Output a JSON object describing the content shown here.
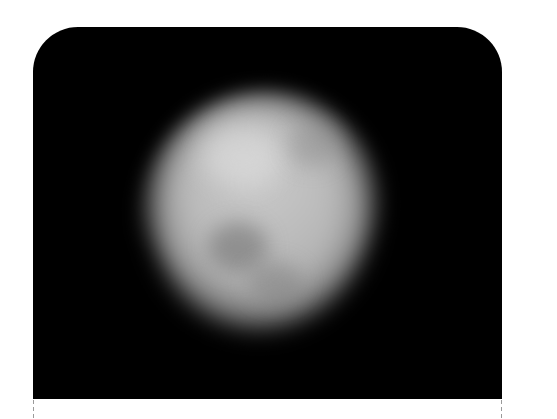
{
  "image": {
    "subject": "blurred-celestial-body",
    "description": "Grayscale telescope image of an irregular, roughly oval rocky body (asteroid/moon) on a black background",
    "colors": {
      "background": "#000000",
      "page": "#ffffff",
      "body_light": "#c9c9c9",
      "body_mid": "#a9a9a9",
      "dark_patch": "#6e6e6e",
      "guide_line": "#9a9a9a"
    }
  }
}
